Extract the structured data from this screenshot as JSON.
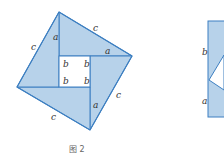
{
  "figure": {
    "caption": "图 2",
    "fill_color": "#b7d2ea",
    "stroke_color": "#3d7fc1",
    "left_diagram": {
      "labels": {
        "c_top": "c",
        "c_left": "c",
        "c_right": "c",
        "c_bottom": "c",
        "a_top": "a",
        "a_right": "a",
        "a_left": "a",
        "a_bottom": "a",
        "b1": "b",
        "b2": "b",
        "b3": "b",
        "b4": "b"
      }
    },
    "right_diagram": {
      "labels": {
        "b": "b",
        "a": "a"
      }
    }
  }
}
